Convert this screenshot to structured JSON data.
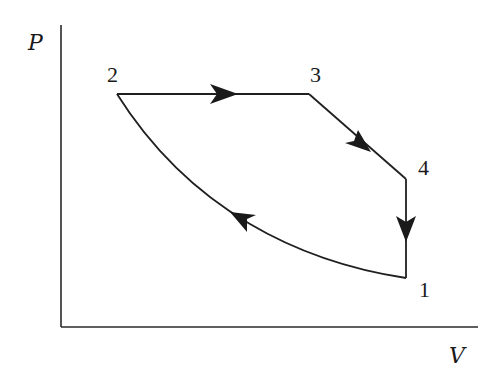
{
  "diagram": {
    "type": "pv-cycle",
    "axes": {
      "y_label": "P",
      "x_label": "V"
    },
    "points": [
      {
        "id": "1",
        "label": "1"
      },
      {
        "id": "2",
        "label": "2"
      },
      {
        "id": "3",
        "label": "3"
      },
      {
        "id": "4",
        "label": "4"
      }
    ],
    "processes": [
      {
        "from": "1",
        "to": "2",
        "shape": "curve",
        "direction": "1→2"
      },
      {
        "from": "2",
        "to": "3",
        "shape": "horizontal line (constant P)",
        "direction": "2→3"
      },
      {
        "from": "3",
        "to": "4",
        "shape": "descending line",
        "direction": "3→4"
      },
      {
        "from": "4",
        "to": "1",
        "shape": "vertical line (constant V)",
        "direction": "4→1"
      }
    ],
    "colors": {
      "line": "#1f1f1f",
      "background": "#ffffff"
    }
  }
}
